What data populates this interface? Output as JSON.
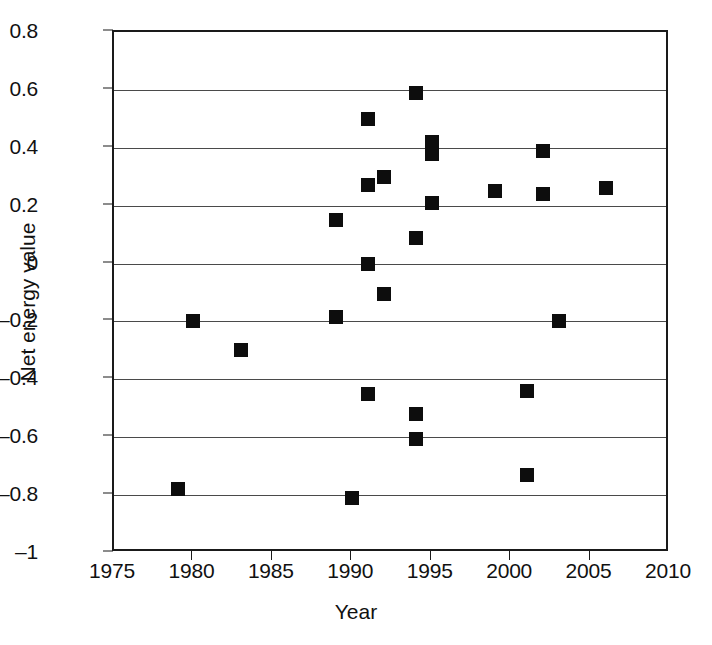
{
  "chart_data": {
    "type": "scatter",
    "title": "",
    "xlabel": "Year",
    "ylabel": "Net energy value",
    "xlim": [
      1975,
      2010
    ],
    "ylim": [
      -1,
      0.8
    ],
    "xticks": [
      1975,
      1980,
      1985,
      1990,
      1995,
      2000,
      2005,
      2010
    ],
    "xtick_labels": [
      "1975",
      "1980",
      "1985",
      "1990",
      "1995",
      "2000",
      "2005",
      "2010"
    ],
    "yticks": [
      0.8,
      0.6,
      0.4,
      0.2,
      0,
      -0.2,
      -0.4,
      -0.6,
      -0.8,
      -1
    ],
    "ytick_labels": [
      "0.8",
      "0.6",
      "0.4",
      "0.2",
      "0",
      "–0.2",
      "–0.4",
      "–0.6",
      "–0.8",
      "–1"
    ],
    "gridlines": [
      0.6,
      0.4,
      0.2,
      0,
      -0.2,
      -0.4,
      -0.6,
      -0.8
    ],
    "grid": true,
    "legend": "none",
    "marker": "filled-square",
    "marker_color": "#0d0d0d",
    "x": [
      1979,
      1980,
      1983,
      1989,
      1989,
      1990,
      1991,
      1991,
      1991,
      1991,
      1992,
      1992,
      1994,
      1994,
      1994,
      1994,
      1995,
      1995,
      1995,
      1999,
      2001,
      2001,
      2002,
      2002,
      2003,
      2006
    ],
    "y": [
      -0.78,
      -0.2,
      -0.3,
      0.15,
      -0.185,
      -0.81,
      0.5,
      0.27,
      0.0,
      -0.45,
      0.3,
      -0.105,
      0.59,
      0.09,
      -0.52,
      -0.605,
      0.42,
      0.38,
      0.21,
      0.25,
      -0.44,
      -0.73,
      0.39,
      0.24,
      -0.2,
      0.26
    ],
    "points": [
      {
        "x": 1979,
        "y": -0.78
      },
      {
        "x": 1980,
        "y": -0.2
      },
      {
        "x": 1983,
        "y": -0.3
      },
      {
        "x": 1989,
        "y": 0.15
      },
      {
        "x": 1989,
        "y": -0.185
      },
      {
        "x": 1990,
        "y": -0.81
      },
      {
        "x": 1991,
        "y": 0.5
      },
      {
        "x": 1991,
        "y": 0.27
      },
      {
        "x": 1991,
        "y": 0.0
      },
      {
        "x": 1991,
        "y": -0.45
      },
      {
        "x": 1992,
        "y": 0.3
      },
      {
        "x": 1992,
        "y": -0.105
      },
      {
        "x": 1994,
        "y": 0.59
      },
      {
        "x": 1994,
        "y": 0.09
      },
      {
        "x": 1994,
        "y": -0.52
      },
      {
        "x": 1994,
        "y": -0.605
      },
      {
        "x": 1995,
        "y": 0.42
      },
      {
        "x": 1995,
        "y": 0.38
      },
      {
        "x": 1995,
        "y": 0.21
      },
      {
        "x": 1999,
        "y": 0.25
      },
      {
        "x": 2001,
        "y": -0.44
      },
      {
        "x": 2001,
        "y": -0.73
      },
      {
        "x": 2002,
        "y": 0.39
      },
      {
        "x": 2002,
        "y": 0.24
      },
      {
        "x": 2003,
        "y": -0.2
      },
      {
        "x": 2006,
        "y": 0.26
      }
    ]
  }
}
